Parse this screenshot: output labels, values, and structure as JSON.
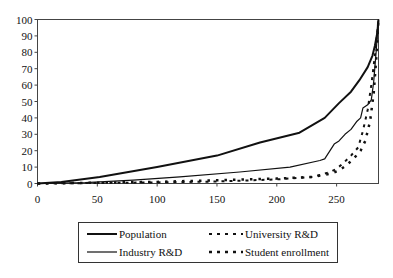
{
  "chart_data": {
    "type": "line",
    "title": "",
    "xlabel": "",
    "ylabel": "",
    "xlim": [
      0,
      285
    ],
    "ylim": [
      0,
      100
    ],
    "x_ticks": [
      0,
      50,
      100,
      150,
      200,
      250
    ],
    "y_ticks": [
      0,
      10,
      20,
      30,
      40,
      50,
      60,
      70,
      80,
      90,
      100
    ],
    "x_tick_labels": [
      "0",
      "50",
      "100",
      "150",
      "200",
      "250"
    ],
    "y_tick_labels": [
      "0",
      "10",
      "20",
      "30",
      "40",
      "50",
      "60",
      "70",
      "80",
      "90",
      "100"
    ],
    "grid": false,
    "legend_position": "bottom",
    "series": [
      {
        "name": "Population",
        "style": "solid-thick",
        "color": "#111111",
        "x": [
          0,
          20,
          52,
          100,
          150,
          186,
          219,
          240,
          252,
          262,
          269,
          276,
          280,
          282,
          284,
          285
        ],
        "y": [
          0,
          1,
          4,
          10,
          17,
          25,
          31,
          40,
          49,
          56,
          63,
          71,
          78,
          84,
          92,
          100
        ]
      },
      {
        "name": "Industry R&D",
        "style": "solid-thin",
        "color": "#111111",
        "x": [
          0,
          40,
          80,
          119,
          169,
          211,
          236,
          240,
          248,
          252,
          257,
          262,
          267,
          270,
          272,
          276,
          279,
          281,
          283,
          285
        ],
        "y": [
          0,
          0.5,
          2,
          4,
          7,
          10,
          14,
          15,
          24,
          26,
          30,
          33,
          38,
          40,
          46,
          48,
          51,
          62,
          80,
          100
        ]
      },
      {
        "name": "University R&D",
        "style": "dashed",
        "color": "#111111",
        "x": [
          0,
          50,
          100,
          150,
          200,
          230,
          245,
          250,
          255,
          262,
          268,
          272,
          276,
          279,
          282,
          285
        ],
        "y": [
          0,
          0.3,
          0.7,
          1.2,
          2.5,
          4,
          7,
          9,
          12,
          17,
          22,
          32,
          45,
          60,
          78,
          100
        ]
      },
      {
        "name": "Student enrollment",
        "style": "dotted",
        "color": "#111111",
        "x": [
          0,
          50,
          100,
          150,
          200,
          230,
          245,
          252,
          258,
          264,
          270,
          274,
          278,
          281,
          283,
          285
        ],
        "y": [
          0,
          0.5,
          1,
          2,
          3,
          4,
          6,
          8,
          11,
          15,
          20,
          26,
          38,
          55,
          75,
          100
        ]
      }
    ]
  }
}
